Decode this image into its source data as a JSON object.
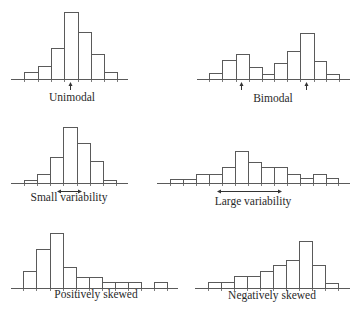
{
  "figure": {
    "stroke_color": "#5a5a5a",
    "fill_color": "#ffffff",
    "text_color": "#2a2a2a"
  },
  "chart_data": [
    {
      "type": "bar",
      "title": "Unimodal",
      "xlabel": "Unimodal",
      "ylabel": "",
      "grid": false,
      "categories": [
        "1",
        "2",
        "3",
        "4",
        "5",
        "6",
        "7"
      ],
      "values": [
        7,
        13,
        31,
        67,
        47,
        25,
        7
      ],
      "annotations": [
        {
          "kind": "up-arrow",
          "at_bin_edge": 3,
          "meaning": "single mode"
        }
      ],
      "geom": {
        "baseline_y": 79,
        "axis_x": [
          11,
          128
        ],
        "edges": [
          24,
          38,
          51,
          64,
          78,
          91,
          104,
          117
        ],
        "label_x": 72,
        "label_y": 101
      }
    },
    {
      "type": "bar",
      "title": "Bimodal",
      "xlabel": "Bimodal",
      "ylabel": "",
      "grid": false,
      "categories": [
        "1",
        "2",
        "3",
        "4",
        "5",
        "6",
        "7",
        "8",
        "9",
        "10"
      ],
      "values": [
        6,
        19,
        25,
        12,
        5,
        16,
        28,
        46,
        18,
        5
      ],
      "annotations": [
        {
          "kind": "up-arrow",
          "x": 241,
          "meaning": "first mode"
        },
        {
          "kind": "up-arrow",
          "x": 306,
          "meaning": "second mode"
        }
      ],
      "geom": {
        "baseline_y": 79,
        "axis_x": [
          197,
          350
        ],
        "edges": [
          209,
          222,
          236,
          249,
          262,
          274,
          287,
          300,
          314,
          326,
          339
        ],
        "label_x": 273,
        "label_y": 102
      }
    },
    {
      "type": "bar",
      "title": "Small variability",
      "xlabel": "Small variability",
      "ylabel": "",
      "grid": false,
      "categories": [
        "1",
        "2",
        "3",
        "4",
        "5",
        "6",
        "7"
      ],
      "values": [
        3,
        9,
        26,
        56,
        40,
        22,
        3
      ],
      "annotations": [
        {
          "kind": "double-arrow",
          "x1": 57,
          "x2": 82,
          "meaning": "spread"
        }
      ],
      "geom": {
        "baseline_y": 183,
        "axis_x": [
          11,
          128
        ],
        "edges": [
          24,
          37,
          50,
          63,
          77,
          90,
          103,
          116
        ],
        "label_x": 69,
        "label_y": 201
      }
    },
    {
      "type": "bar",
      "title": "Large variability",
      "xlabel": "Large variability",
      "ylabel": "",
      "grid": false,
      "categories": [
        "1",
        "2",
        "3",
        "4",
        "5",
        "6",
        "7",
        "8",
        "9",
        "10",
        "11",
        "12",
        "13"
      ],
      "values": [
        4,
        4,
        9,
        9,
        16,
        32,
        21,
        16,
        16,
        9,
        5,
        9,
        5
      ],
      "annotations": [
        {
          "kind": "double-arrow",
          "x1": 217,
          "x2": 282,
          "meaning": "spread"
        }
      ],
      "geom": {
        "baseline_y": 183,
        "axis_x": [
          157,
          350
        ],
        "edges": [
          170,
          183,
          196,
          209,
          222,
          235,
          248,
          261,
          274,
          287,
          300,
          313,
          326,
          338
        ],
        "label_x": 253,
        "label_y": 205
      }
    },
    {
      "type": "bar",
      "title": "Positively skewed",
      "xlabel": "Positively skewed",
      "ylabel": "",
      "grid": false,
      "categories": [
        "1",
        "2",
        "3",
        "4",
        "5",
        "6",
        "7",
        "8",
        "9",
        "10",
        "11"
      ],
      "values": [
        17,
        39,
        55,
        21,
        11,
        11,
        6,
        6,
        6,
        0,
        6
      ],
      "annotations": [],
      "geom": {
        "baseline_y": 288,
        "axis_x": [
          11,
          178
        ],
        "edges": [
          23,
          36,
          50,
          63,
          76,
          89,
          102,
          115,
          128,
          141,
          154,
          167
        ],
        "label_x": 96,
        "label_y": 298
      }
    },
    {
      "type": "bar",
      "title": "Negatively skewed",
      "xlabel": "Negatively skewed",
      "ylabel": "",
      "grid": false,
      "categories": [
        "1",
        "2",
        "3",
        "4",
        "5",
        "6",
        "7",
        "8",
        "9",
        "10"
      ],
      "values": [
        6,
        6,
        12,
        12,
        17,
        23,
        28,
        47,
        23,
        5
      ],
      "annotations": [],
      "geom": {
        "baseline_y": 288,
        "axis_x": [
          195,
          350
        ],
        "edges": [
          208,
          221,
          234,
          247,
          260,
          273,
          286,
          299,
          312,
          325,
          338
        ],
        "label_x": 272,
        "label_y": 299
      }
    }
  ]
}
